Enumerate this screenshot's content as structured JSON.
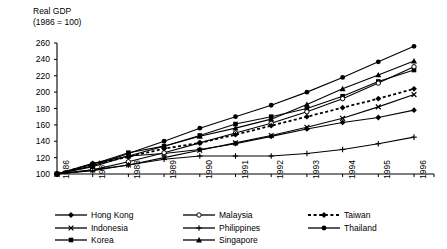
{
  "chart_data": {
    "type": "line",
    "title": "Real GDP",
    "subtitle": "(1986 = 100)",
    "xlabel": "",
    "ylabel": "",
    "ylim": [
      100,
      260
    ],
    "yticks": [
      100,
      120,
      140,
      160,
      180,
      200,
      220,
      240,
      260
    ],
    "grid": false,
    "legend_position": "bottom",
    "categories": [
      "1986",
      "1987",
      "1988",
      "1989",
      "1990",
      "1991",
      "1992",
      "1993",
      "1994",
      "1995",
      "1996"
    ],
    "series": [
      {
        "name": "Hong Kong",
        "marker": "filled-diamond",
        "line": "solid",
        "values": [
          100,
          113,
          122,
          125,
          130,
          137,
          146,
          155,
          163,
          169,
          178
        ]
      },
      {
        "name": "Indonesia",
        "marker": "x-cross",
        "line": "solid",
        "values": [
          100,
          105,
          111,
          120,
          129,
          138,
          147,
          157,
          168,
          182,
          197
        ]
      },
      {
        "name": "Korea",
        "marker": "filled-square",
        "line": "solid",
        "values": [
          100,
          112,
          126,
          134,
          147,
          161,
          170,
          180,
          195,
          213,
          227
        ]
      },
      {
        "name": "Malaysia",
        "marker": "open-circle",
        "line": "solid",
        "values": [
          100,
          105,
          115,
          126,
          138,
          150,
          162,
          176,
          192,
          211,
          231
        ]
      },
      {
        "name": "Philippines",
        "marker": "plus-cross",
        "line": "solid",
        "values": [
          100,
          104,
          111,
          118,
          122,
          122,
          122,
          125,
          130,
          137,
          145
        ]
      },
      {
        "name": "Singapore",
        "marker": "filled-triangle",
        "line": "solid",
        "values": [
          100,
          109,
          122,
          134,
          146,
          156,
          167,
          185,
          204,
          221,
          238
        ]
      },
      {
        "name": "Taiwan",
        "marker": "filled-diamond",
        "line": "dashed",
        "values": [
          100,
          112,
          121,
          131,
          138,
          148,
          159,
          170,
          181,
          192,
          204
        ]
      },
      {
        "name": "Thailand",
        "marker": "filled-circle",
        "line": "solid",
        "values": [
          100,
          110,
          125,
          140,
          156,
          170,
          184,
          200,
          218,
          237,
          256
        ]
      }
    ]
  },
  "legend": {
    "items": [
      {
        "label": "Hong Kong",
        "marker": "filled-diamond",
        "line": "solid"
      },
      {
        "label": "Indonesia",
        "marker": "x-cross",
        "line": "solid"
      },
      {
        "label": "Korea",
        "marker": "filled-square",
        "line": "solid"
      },
      {
        "label": "Malaysia",
        "marker": "open-circle",
        "line": "solid"
      },
      {
        "label": "Philippines",
        "marker": "plus-cross",
        "line": "solid"
      },
      {
        "label": "Singapore",
        "marker": "filled-triangle",
        "line": "solid"
      },
      {
        "label": "Taiwan",
        "marker": "filled-diamond",
        "line": "dashed"
      },
      {
        "label": "Thailand",
        "marker": "filled-circle",
        "line": "solid"
      }
    ],
    "column_order": [
      "Hong Kong",
      "Malaysia",
      "Taiwan",
      "Indonesia",
      "Philippines",
      "Thailand",
      "Korea",
      "Singapore"
    ]
  },
  "colors": {
    "line": "#000000",
    "axis": "#000000",
    "background": "#ffffff"
  }
}
